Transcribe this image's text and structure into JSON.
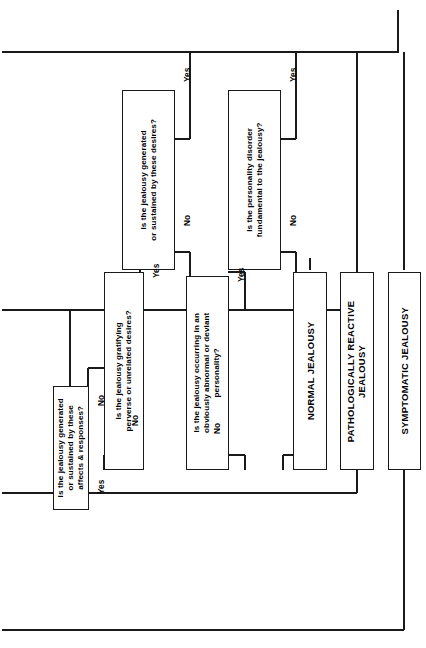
{
  "diagram": {
    "orientation": "rotated-90",
    "line_color": "#1a1a1a",
    "box_fill": "#ffffff",
    "decisions": [
      {
        "id": "d1",
        "text": "Is the jealousy generated\nor sustained by these\naffects & responses?",
        "yes_label": "Yes",
        "no_label": "No"
      },
      {
        "id": "d2",
        "text": "Is the jealousy gratifying\nperverse or unrelated desires?",
        "yes_label": "Yes",
        "no_label": "No"
      },
      {
        "id": "d3",
        "text": "Is the jealousy occurring in an\nobviously abnormal or deviant\npersonality?",
        "yes_label": "Yes",
        "no_label": "No"
      },
      {
        "id": "d4",
        "text": "Is the jealousy generated\nor sustained by these desires?",
        "yes_label": "Yes",
        "no_label": "No"
      },
      {
        "id": "d5",
        "text": "Is the personality disorder\nfundamental to the jealousy?",
        "yes_label": "Yes",
        "no_label": "No"
      }
    ],
    "outcomes": [
      {
        "id": "o1",
        "text": "NORMAL JEALOUSY"
      },
      {
        "id": "o2",
        "text": "PATHOLOGICALLY REACTIVE\nJEALOUSY"
      },
      {
        "id": "o3",
        "text": "SYMPTOMATIC JEALOUSY"
      }
    ]
  }
}
